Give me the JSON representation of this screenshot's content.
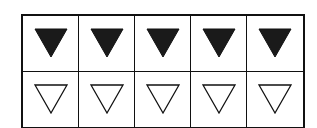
{
  "grid": {
    "columns": 5,
    "rows": [
      {
        "name": "filled-row",
        "cells": [
          "filled-down-triangle",
          "filled-down-triangle",
          "filled-down-triangle",
          "filled-down-triangle",
          "filled-down-triangle"
        ]
      },
      {
        "name": "outline-row",
        "cells": [
          "outline-down-triangle",
          "outline-down-triangle",
          "outline-down-triangle",
          "outline-down-triangle",
          "outline-down-triangle"
        ]
      }
    ]
  },
  "colors": {
    "stroke": "#111111",
    "fill": "#1a1a1a",
    "background": "#ffffff"
  }
}
